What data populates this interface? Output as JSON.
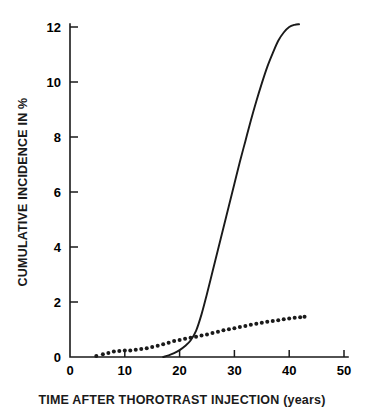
{
  "chart_data": {
    "type": "line",
    "title": "",
    "xlabel": "TIME AFTER THOROTRAST INJECTION (years)",
    "ylabel": "CUMULATIVE INCIDENCE IN %",
    "xlim": [
      0,
      52
    ],
    "ylim": [
      0,
      12.6
    ],
    "xticks": [
      0,
      10,
      20,
      30,
      40,
      50
    ],
    "yticks": [
      0,
      2,
      4,
      6,
      8,
      10,
      12
    ],
    "xtick_labels": [
      "0",
      "10",
      "20",
      "30",
      "40",
      "50"
    ],
    "ytick_labels": [
      "0",
      "2",
      "4",
      "6",
      "8",
      "10",
      "12"
    ],
    "grid": false,
    "legend": false,
    "legend_position": "none",
    "series": [
      {
        "name": "solid-curve",
        "style": "solid-line",
        "points": [
          [
            17.0,
            0.0
          ],
          [
            18.0,
            0.06
          ],
          [
            19.0,
            0.14
          ],
          [
            20.0,
            0.25
          ],
          [
            21.0,
            0.4
          ],
          [
            22.0,
            0.6
          ],
          [
            23.0,
            0.95
          ],
          [
            24.0,
            1.55
          ],
          [
            25.0,
            2.3
          ],
          [
            26.0,
            3.1
          ],
          [
            27.0,
            3.9
          ],
          [
            28.0,
            4.7
          ],
          [
            29.0,
            5.5
          ],
          [
            30.0,
            6.3
          ],
          [
            31.0,
            7.1
          ],
          [
            32.0,
            7.85
          ],
          [
            33.0,
            8.6
          ],
          [
            34.0,
            9.3
          ],
          [
            35.0,
            9.95
          ],
          [
            36.0,
            10.55
          ],
          [
            37.0,
            11.05
          ],
          [
            38.0,
            11.5
          ],
          [
            39.0,
            11.8
          ],
          [
            40.0,
            12.0
          ],
          [
            41.0,
            12.08
          ],
          [
            41.8,
            12.1
          ]
        ]
      },
      {
        "name": "dotted-curve",
        "style": "dotted",
        "points": [
          [
            4.8,
            0.04
          ],
          [
            6.0,
            0.1
          ],
          [
            7.0,
            0.15
          ],
          [
            8.0,
            0.2
          ],
          [
            9.0,
            0.22
          ],
          [
            10.0,
            0.24
          ],
          [
            11.0,
            0.24
          ],
          [
            12.0,
            0.26
          ],
          [
            13.0,
            0.29
          ],
          [
            14.0,
            0.32
          ],
          [
            15.0,
            0.36
          ],
          [
            16.0,
            0.41
          ],
          [
            17.0,
            0.46
          ],
          [
            18.0,
            0.52
          ],
          [
            19.0,
            0.58
          ],
          [
            20.0,
            0.62
          ],
          [
            21.0,
            0.66
          ],
          [
            22.0,
            0.7
          ],
          [
            23.0,
            0.74
          ],
          [
            24.0,
            0.78
          ],
          [
            25.0,
            0.82
          ],
          [
            26.0,
            0.87
          ],
          [
            27.0,
            0.92
          ],
          [
            28.0,
            0.97
          ],
          [
            29.0,
            1.01
          ],
          [
            30.0,
            1.05
          ],
          [
            31.0,
            1.09
          ],
          [
            32.0,
            1.13
          ],
          [
            33.0,
            1.17
          ],
          [
            34.0,
            1.21
          ],
          [
            35.0,
            1.25
          ],
          [
            36.0,
            1.28
          ],
          [
            37.0,
            1.31
          ],
          [
            38.0,
            1.34
          ],
          [
            39.0,
            1.37
          ],
          [
            40.0,
            1.4
          ],
          [
            41.0,
            1.43
          ],
          [
            42.0,
            1.45
          ],
          [
            42.8,
            1.46
          ]
        ]
      }
    ]
  }
}
